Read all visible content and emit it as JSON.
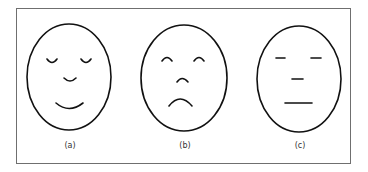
{
  "figure": {
    "faces": [
      {
        "id": "a",
        "label": "(a)",
        "expression": "happy",
        "eyes": "closed-smiling",
        "nose": "smile-arc",
        "mouth": "smile"
      },
      {
        "id": "b",
        "label": "(b)",
        "expression": "sad",
        "eyes": "arched",
        "nose": "arch",
        "mouth": "frown"
      },
      {
        "id": "c",
        "label": "(c)",
        "expression": "neutral",
        "eyes": "flat-lines",
        "nose": "flat-line",
        "mouth": "flat-line"
      }
    ],
    "stroke_color": "#111111",
    "border_color": "#6f6f6f"
  }
}
